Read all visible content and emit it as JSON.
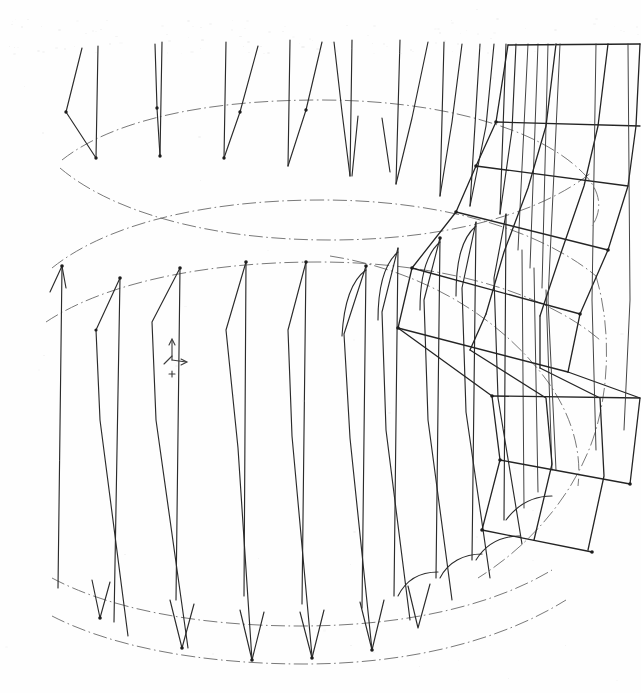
{
  "document": {
    "kind": "engineering-wireframe-drawing",
    "title": "Cylindrical Rotor Cage Wireframe",
    "background_color": "#fefefe",
    "line_color": "#2b2b2b",
    "construction_line_color": "#5a5a5a",
    "speck_color": "#cfcfcf",
    "width": 641,
    "height": 693
  },
  "chart_data": {
    "type": "line",
    "xlabel": "",
    "ylabel": "",
    "projection": "axonometric",
    "grid": false,
    "legend": "none",
    "xlim": [
      0,
      641
    ],
    "ylim": [
      0,
      693
    ],
    "construction_ellipses": [
      {
        "name": "top-outer-rim",
        "cx": 330,
        "cy": 195,
        "rx": 268,
        "ry": 98,
        "style": "dash-dot",
        "visible_arc_deg": [
          150,
          390
        ]
      },
      {
        "name": "top-inner-rim",
        "cx": 330,
        "cy": 250,
        "rx": 268,
        "ry": 98,
        "style": "dash-dot",
        "visible_arc_deg": [
          150,
          390
        ]
      },
      {
        "name": "mid-band-circle",
        "cx": 330,
        "cy": 375,
        "rx": 268,
        "ry": 98,
        "style": "dash-dot",
        "visible_arc_deg": [
          150,
          390
        ]
      },
      {
        "name": "bottom-rim-upper",
        "cx": 330,
        "cy": 530,
        "rx": 268,
        "ry": 98,
        "style": "dash-dot",
        "visible_arc_deg": [
          150,
          390
        ]
      },
      {
        "name": "bottom-rim-lower",
        "cx": 330,
        "cy": 570,
        "rx": 268,
        "ry": 98,
        "style": "dash-dot",
        "visible_arc_deg": [
          150,
          390
        ]
      }
    ],
    "blade_count_upper": 12,
    "blade_count_lower": 12,
    "mesh_patch": {
      "name": "right-flank-quad-mesh",
      "rows": 6,
      "cols": 3,
      "origin_x": 470,
      "origin_y": 45
    },
    "axis_triad": {
      "name": "coordinate-triad-marker",
      "x": 172,
      "y": 348,
      "labels": [
        "",
        "",
        ""
      ]
    }
  },
  "annotations": {
    "axis_marker_label": "",
    "scan_artifact": "faint toner speckle band across the upper margin"
  }
}
